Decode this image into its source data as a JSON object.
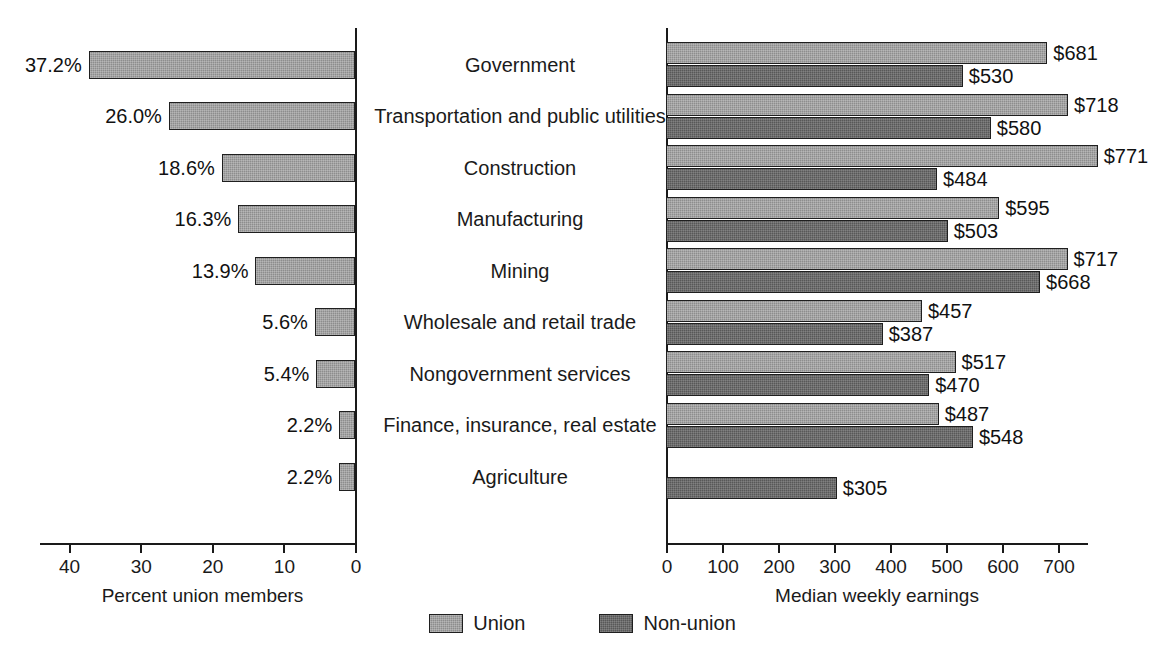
{
  "chart_data": {
    "type": "bar",
    "title": "",
    "orientation": "horizontal",
    "layout": "butterfly-two-panel",
    "categories": [
      "Government",
      "Transportation and public utilities",
      "Construction",
      "Manufacturing",
      "Mining",
      "Wholesale and retail trade",
      "Nongovernment services",
      "Finance, insurance, real estate",
      "Agriculture"
    ],
    "legend": {
      "position": "bottom-center",
      "entries": [
        {
          "name": "Union",
          "color": "#8d8d8d"
        },
        {
          "name": "Non-union",
          "color": "#585858"
        }
      ]
    },
    "panels": [
      {
        "id": "left",
        "xlabel": "Percent union members",
        "ylabel": "",
        "xlim": [
          0,
          44
        ],
        "reversed": true,
        "grid": false,
        "ticks": [
          40,
          30,
          20,
          10,
          0
        ],
        "tick_labels": [
          "40",
          "30",
          "20",
          "10",
          "0"
        ],
        "series": [
          {
            "name": "Percent union members",
            "values": [
              37.2,
              26.0,
              18.6,
              16.3,
              13.9,
              5.6,
              5.4,
              2.2,
              2.2
            ],
            "value_labels": [
              "37.2%",
              "26.0%",
              "18.6%",
              "16.3%",
              "13.9%",
              "5.6%",
              "5.4%",
              "2.2%",
              "2.2%"
            ],
            "color": "#8d8d8d"
          }
        ]
      },
      {
        "id": "right",
        "xlabel": "Median weekly earnings",
        "ylabel": "",
        "xlim": [
          0,
          800
        ],
        "reversed": false,
        "grid": false,
        "ticks": [
          0,
          100,
          200,
          300,
          400,
          500,
          600,
          700
        ],
        "tick_labels": [
          "0",
          "100",
          "200",
          "300",
          "400",
          "500",
          "600",
          "700"
        ],
        "series": [
          {
            "name": "Union",
            "color": "#8d8d8d",
            "values": [
              681,
              718,
              771,
              595,
              717,
              457,
              517,
              487,
              null
            ],
            "value_labels": [
              "$681",
              "$718",
              "$771",
              "$595",
              "$717",
              "$457",
              "$517",
              "$487",
              null
            ]
          },
          {
            "name": "Non-union",
            "color": "#585858",
            "values": [
              530,
              580,
              484,
              503,
              668,
              387,
              470,
              548,
              305
            ],
            "value_labels": [
              "$530",
              "$580",
              "$484",
              "$503",
              "$668",
              "$387",
              "$470",
              "$548",
              "$305"
            ]
          }
        ]
      }
    ]
  }
}
